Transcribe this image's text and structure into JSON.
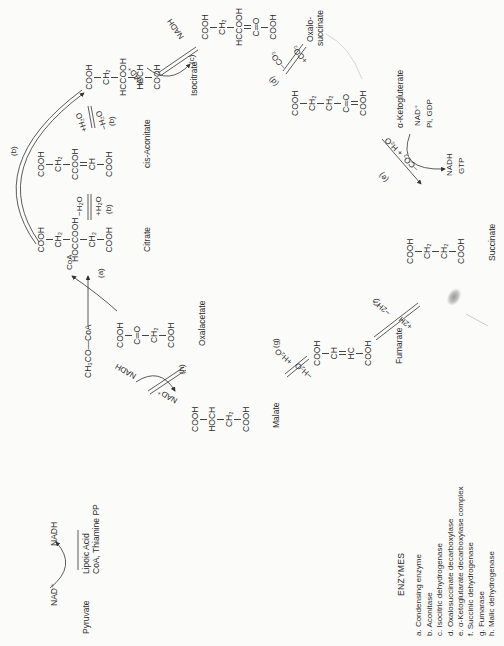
{
  "diagram": {
    "orientation": "rotated -90deg",
    "colors": {
      "ink": "#2b2b2b",
      "paper": "#fbfbfa",
      "faint_line": "#b5b5b5"
    }
  },
  "pre_step": {
    "substrate": "Pyruvate",
    "cofactor_in": "NAD⁺",
    "cofactor_out": "NADH",
    "coenzymes_line1": "Lipoic Acid",
    "coenzymes_line2": "CoA, Thiamine PP",
    "product": "CH₃CO—CoA"
  },
  "compounds": {
    "oxalacetate": {
      "name": "Oxalacetate",
      "groups": [
        "COOH",
        "C═O",
        "CH₂",
        "COOH"
      ]
    },
    "citrate": {
      "name": "Citrate",
      "groups": [
        "COOH",
        "CH₂",
        "HOCCOOH",
        "CH₂",
        "COOH"
      ]
    },
    "cis_aconitate": {
      "name": "cis-Aconitate",
      "groups": [
        "COOH",
        "CH₂",
        "CCOOH",
        "CH",
        "COOH"
      ]
    },
    "isocitrate": {
      "name": "Isocitrate",
      "groups": [
        "COOH",
        "CH₂",
        "HCCOOH",
        "HOCH",
        "COOH"
      ]
    },
    "oxalosuccinate": {
      "name_line1": "Oxalo-",
      "name_line2": "succinate",
      "groups": [
        "COOH",
        "CH₂",
        "HCCOOH",
        "C═O",
        "COOH"
      ]
    },
    "alpha_ketoglutarate": {
      "name": "α-Ketogluterate",
      "groups": [
        "COOH",
        "CH₂",
        "CH₂",
        "C═O",
        "COOH"
      ]
    },
    "succinate": {
      "name": "Succinate",
      "groups": [
        "COOH",
        "CH₂",
        "CH₂",
        "COOH"
      ]
    },
    "fumarate": {
      "name": "Fumarate",
      "groups": [
        "COOH",
        "CH",
        "HC",
        "COOH"
      ]
    },
    "malate": {
      "name": "Malate",
      "groups": [
        "COOH",
        "HOCH",
        "CH₂",
        "COOH"
      ]
    }
  },
  "reactions": {
    "a": {
      "label": "(a)",
      "released": "CoA"
    },
    "b1": {
      "label": "(b)",
      "top": "−H₂O",
      "bottom": "+H₂O"
    },
    "b2": {
      "label": "(b)",
      "top": "+H₂O",
      "bottom": "−H₂O"
    },
    "b_bypass": {
      "label": "(b)"
    },
    "c": {
      "label": "(c)",
      "in": "NAD⁺",
      "out": "NADH"
    },
    "d": {
      "label": "(d)",
      "top": "−CO₂",
      "bottom": "+CO₂"
    },
    "e": {
      "label": "(e)",
      "condition": "−CO₂ + H₂O",
      "in_line1": "NAD⁺",
      "in_line2": "Pi, GDP",
      "out_line1": "NADH",
      "out_line2": "GTP"
    },
    "f": {
      "label": "(f)",
      "top": "−2H",
      "bottom": "+2H"
    },
    "g": {
      "label": "(g)",
      "top": "+H₂O",
      "bottom": "−H₂O"
    },
    "h": {
      "label": "(h)",
      "in": "NAD⁺",
      "out": "NADH"
    }
  },
  "enzymes": {
    "heading": "ENZYMES",
    "items": [
      "a. Condensing enzyme",
      "b. Aconitase",
      "c. Isocitric dehydrogenase",
      "d. Oxalosuccinate decarboxylase",
      "e. α-Ketoglutarate decarboxylase complex",
      "f. Succinic dehydrogenase",
      "g. Fumarase",
      "h. Malic dehydrogenase"
    ]
  }
}
